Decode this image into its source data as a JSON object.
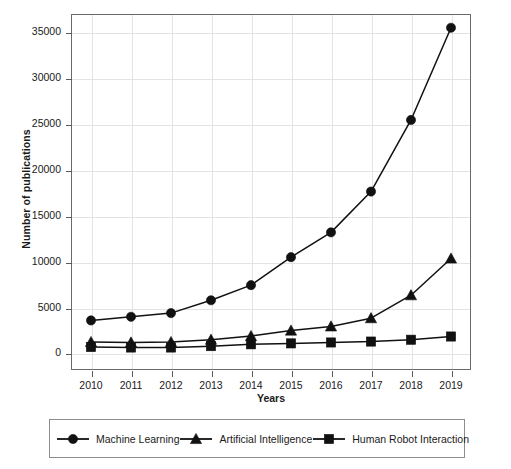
{
  "chart_data": {
    "type": "line",
    "title": "",
    "xlabel": "Years",
    "ylabel": "Number of publications",
    "categories": [
      "2010",
      "2011",
      "2012",
      "2013",
      "2014",
      "2015",
      "2016",
      "2017",
      "2018",
      "2019"
    ],
    "x": [
      2010,
      2011,
      2012,
      2013,
      2014,
      2015,
      2016,
      2017,
      2018,
      2019
    ],
    "xlim": [
      2009.5,
      2019.5
    ],
    "ylim": [
      -1800,
      37000
    ],
    "yticks": [
      0,
      5000,
      10000,
      15000,
      20000,
      25000,
      30000,
      35000
    ],
    "ytick_labels": [
      "0",
      "5000",
      "10000",
      "15000",
      "20000",
      "25000",
      "30000",
      "35000"
    ],
    "grid": true,
    "legend_position": "below",
    "series": [
      {
        "name": "Machine Learning",
        "marker": "circle",
        "color": "#111111",
        "values": [
          3600,
          4000,
          4400,
          5800,
          7450,
          10500,
          13200,
          17650,
          25450,
          35500
        ]
      },
      {
        "name": "Artificial Intelligence",
        "marker": "triangle",
        "color": "#111111",
        "values": [
          1250,
          1200,
          1250,
          1500,
          1900,
          2500,
          2950,
          3850,
          6350,
          10350
        ]
      },
      {
        "name": "Human Robot Interaction",
        "marker": "square",
        "color": "#111111",
        "values": [
          700,
          650,
          650,
          800,
          1000,
          1100,
          1200,
          1300,
          1500,
          1850
        ]
      }
    ]
  },
  "legend": {
    "items": [
      {
        "label": "Machine Learning",
        "marker": "circle-marker-icon"
      },
      {
        "label": "Artificial Intelligence",
        "marker": "triangle-marker-icon"
      },
      {
        "label": "Human Robot Interaction",
        "marker": "square-marker-icon"
      }
    ]
  },
  "axes": {
    "x_title": "Years",
    "y_title": "Number of publications"
  }
}
